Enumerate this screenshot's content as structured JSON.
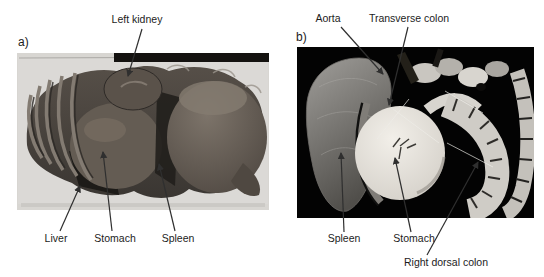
{
  "figure": {
    "background_color": "#ffffff",
    "label_text_color": "#1c1c1c",
    "arrow_color": "#2f2f2f",
    "panel_a": {
      "tag": "a)",
      "photo_alt": "plastinated abdominal specimen, lateral view, light background",
      "photo_background": "#d8d6d2",
      "labels": {
        "left_kidney": "Left kidney",
        "liver": "Liver",
        "stomach": "Stomach",
        "spleen": "Spleen"
      }
    },
    "panel_b": {
      "tag": "b)",
      "photo_alt": "dissected abdominal viscera specimen on black background",
      "photo_background": "#030303",
      "labels": {
        "aorta": "Aorta",
        "transverse_colon": "Transverse colon",
        "spleen": "Spleen",
        "stomach": "Stomach",
        "right_dorsal_colon": "Right dorsal colon"
      }
    }
  }
}
